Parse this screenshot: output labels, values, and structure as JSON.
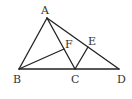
{
  "diagram": {
    "type": "geometry-figure",
    "stroke_color": "#222222",
    "label_color": "#333333",
    "points": {
      "A": {
        "x": 47,
        "y": 18,
        "label": "A",
        "lx": 45,
        "ly": 14
      },
      "B": {
        "x": 19,
        "y": 69,
        "label": "B",
        "lx": 14,
        "ly": 83
      },
      "C": {
        "x": 75,
        "y": 69,
        "label": "C",
        "lx": 71,
        "ly": 83
      },
      "D": {
        "x": 119,
        "y": 69,
        "label": "D",
        "lx": 117,
        "ly": 83
      },
      "E": {
        "x": 88,
        "y": 47,
        "label": "E",
        "lx": 88,
        "ly": 45
      },
      "F": {
        "x": 64,
        "y": 49,
        "label": "F",
        "lx": 65,
        "ly": 48
      }
    },
    "segments": [
      [
        "A",
        "B"
      ],
      [
        "A",
        "D"
      ],
      [
        "B",
        "D"
      ],
      [
        "A",
        "C"
      ],
      [
        "B",
        "F"
      ],
      [
        "C",
        "E"
      ]
    ]
  }
}
